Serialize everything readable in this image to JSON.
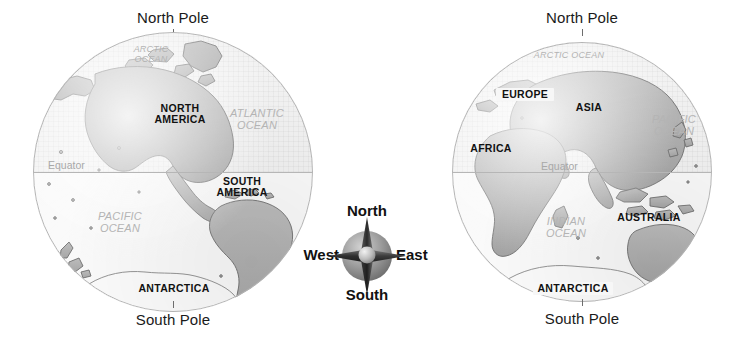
{
  "figure": {
    "background": "#ffffff",
    "land_color": "#b0b0b0",
    "ocean_color": "#f7f7f7",
    "ocean_label_color": "#b4b4b4",
    "continent_label_color": "#111111",
    "equator_color": "#b6b6b6"
  },
  "western_hemisphere": {
    "name": "western-hemisphere",
    "north_pole_label": "North Pole",
    "south_pole_label": "South Pole",
    "equator_label": "Equator",
    "continents": [
      {
        "label": "NORTH\nAMERICA",
        "line1": "NORTH",
        "line2": "AMERICA",
        "name": "north-america"
      },
      {
        "label": "SOUTH\nAMERICA",
        "line1": "SOUTH",
        "line2": "AMERICA",
        "name": "south-america"
      },
      {
        "label": "ANTARCTICA",
        "line1": "ANTARCTICA",
        "line2": "",
        "name": "antarctica"
      }
    ],
    "oceans": [
      {
        "line1": "ARCTIC",
        "line2": "OCEAN",
        "name": "arctic-ocean"
      },
      {
        "line1": "ATLANTIC",
        "line2": "OCEAN",
        "name": "atlantic-ocean"
      },
      {
        "line1": "PACIFIC",
        "line2": "OCEAN",
        "name": "pacific-ocean"
      }
    ]
  },
  "eastern_hemisphere": {
    "name": "eastern-hemisphere",
    "north_pole_label": "North Pole",
    "south_pole_label": "South Pole",
    "equator_label": "Equator",
    "continents": [
      {
        "line1": "EUROPE",
        "line2": "",
        "name": "europe"
      },
      {
        "line1": "ASIA",
        "line2": "",
        "name": "asia"
      },
      {
        "line1": "AFRICA",
        "line2": "",
        "name": "africa"
      },
      {
        "line1": "AUSTRALIA",
        "line2": "",
        "name": "australia"
      },
      {
        "line1": "ANTARCTICA",
        "line2": "",
        "name": "antarctica"
      }
    ],
    "oceans": [
      {
        "line1": "ARCTIC OCEAN",
        "line2": "",
        "name": "arctic-ocean"
      },
      {
        "line1": "PACIFIC",
        "line2": "OCEAN",
        "name": "pacific-ocean"
      },
      {
        "line1": "INDIAN",
        "line2": "OCEAN",
        "name": "indian-ocean"
      }
    ]
  },
  "compass": {
    "name": "compass-rose",
    "north": "North",
    "south": "South",
    "east": "East",
    "west": "West",
    "star_color": "#2b2b2b",
    "disc_color": "#8f8f8f"
  }
}
